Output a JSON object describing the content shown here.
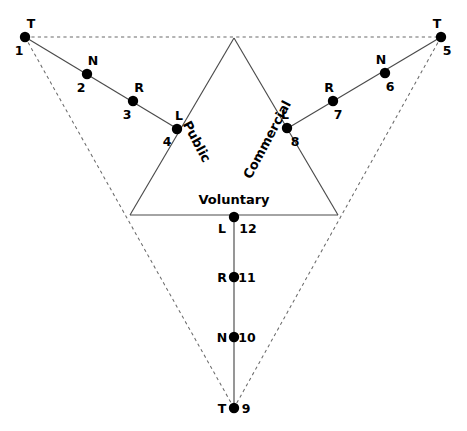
{
  "diagram": {
    "colors": {
      "background": "#ffffff",
      "solid_stroke": "#4a4a4a",
      "dashed_stroke": "#6b6b6b",
      "dot_fill": "#000000",
      "text": "#000000"
    },
    "sector_labels": [
      {
        "id": "public",
        "text": "Public",
        "x": 196,
        "y": 142,
        "rotation": 62
      },
      {
        "id": "commercial",
        "text": "Commercial",
        "x": 268,
        "y": 140,
        "rotation": -62
      },
      {
        "id": "voluntary",
        "text": "Voluntary",
        "x": 234,
        "y": 200,
        "rotation": 0
      }
    ],
    "nodes": [
      {
        "id": "n1",
        "letter": "T",
        "number": "1",
        "x": 25,
        "y": 37,
        "letter_dx": 6,
        "letter_dy": -13,
        "number_dx": -6,
        "number_dy": 14,
        "branch": "public"
      },
      {
        "id": "n2",
        "letter": "N",
        "number": "2",
        "x": 87,
        "y": 74,
        "letter_dx": 6,
        "letter_dy": -13,
        "number_dx": -6,
        "number_dy": 14,
        "branch": "public"
      },
      {
        "id": "n3",
        "letter": "R",
        "number": "3",
        "x": 133,
        "y": 101,
        "letter_dx": 6,
        "letter_dy": -13,
        "number_dx": -6,
        "number_dy": 14,
        "branch": "public"
      },
      {
        "id": "n4",
        "letter": "L",
        "number": "4",
        "x": 177,
        "y": 129,
        "letter_dx": 2,
        "letter_dy": -13,
        "number_dx": -10,
        "number_dy": 13,
        "branch": "public"
      },
      {
        "id": "n5",
        "letter": "T",
        "number": "5",
        "x": 441,
        "y": 37,
        "letter_dx": -4,
        "letter_dy": -13,
        "number_dx": 6,
        "number_dy": 14,
        "branch": "commercial"
      },
      {
        "id": "n6",
        "letter": "N",
        "number": "6",
        "x": 385,
        "y": 73,
        "letter_dx": -4,
        "letter_dy": -13,
        "number_dx": 5,
        "number_dy": 14,
        "branch": "commercial"
      },
      {
        "id": "n7",
        "letter": "R",
        "number": "7",
        "x": 333,
        "y": 101,
        "letter_dx": -4,
        "letter_dy": -13,
        "number_dx": 5,
        "number_dy": 14,
        "branch": "commercial"
      },
      {
        "id": "n8",
        "letter": "L",
        "number": "8",
        "x": 287,
        "y": 128,
        "letter_dx": -2,
        "letter_dy": -13,
        "number_dx": 8,
        "number_dy": 14,
        "branch": "commercial"
      },
      {
        "id": "n9",
        "letter": "T",
        "number": "9",
        "x": 234,
        "y": 408,
        "letter_dx": -12,
        "letter_dy": 1,
        "number_dx": 12,
        "number_dy": 1,
        "branch": "voluntary"
      },
      {
        "id": "n10",
        "letter": "N",
        "number": "10",
        "x": 234,
        "y": 337,
        "letter_dx": -12,
        "letter_dy": 1,
        "number_dx": 13,
        "number_dy": 1,
        "branch": "voluntary"
      },
      {
        "id": "n11",
        "letter": "R",
        "number": "11",
        "x": 234,
        "y": 277,
        "letter_dx": -12,
        "letter_dy": 1,
        "number_dx": 13,
        "number_dy": 1,
        "branch": "voluntary"
      },
      {
        "id": "n12",
        "letter": "L",
        "number": "12",
        "x": 234,
        "y": 217,
        "letter_dx": -12,
        "letter_dy": 12,
        "number_dx": 14,
        "number_dy": 12,
        "branch": "voluntary"
      }
    ],
    "inner_triangle": {
      "apex": {
        "x": 234,
        "y": 38
      },
      "bottom_left": {
        "x": 130,
        "y": 215
      },
      "bottom_right": {
        "x": 338,
        "y": 215
      }
    },
    "solid_segments": [
      {
        "id": "public-branch",
        "x1": 25,
        "y1": 37,
        "x2": 181,
        "y2": 131
      },
      {
        "id": "commercial-branch",
        "x1": 441,
        "y1": 37,
        "x2": 283,
        "y2": 131
      },
      {
        "id": "voluntary-branch",
        "x1": 234,
        "y1": 215,
        "x2": 234,
        "y2": 408
      },
      {
        "id": "inner-left-side",
        "x1": 234,
        "y1": 38,
        "x2": 130,
        "y2": 215
      },
      {
        "id": "inner-right-side",
        "x1": 234,
        "y1": 38,
        "x2": 338,
        "y2": 215
      },
      {
        "id": "inner-base",
        "x1": 130,
        "y1": 215,
        "x2": 338,
        "y2": 215
      }
    ],
    "dashed_segments": [
      {
        "id": "outer-top",
        "x1": 25,
        "y1": 37,
        "x2": 441,
        "y2": 37
      },
      {
        "id": "outer-left-side",
        "x1": 25,
        "y1": 37,
        "x2": 234,
        "y2": 408
      },
      {
        "id": "outer-right-side",
        "x1": 441,
        "y1": 37,
        "x2": 234,
        "y2": 408
      }
    ],
    "dot_radius": 5.2
  }
}
